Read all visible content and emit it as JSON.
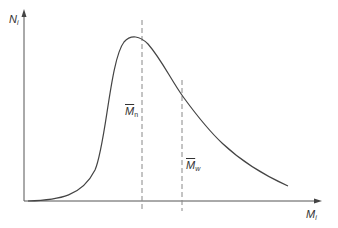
{
  "diagram": {
    "type": "distribution-curve",
    "y_axis": {
      "label": "N",
      "subscript": "i"
    },
    "x_axis": {
      "label": "M",
      "subscript": "i"
    },
    "markers": [
      {
        "id": "mn",
        "label": "M",
        "subscript": "n",
        "overbar": true
      },
      {
        "id": "mw",
        "label": "M",
        "subscript": "w",
        "overbar": true
      }
    ],
    "colors": {
      "curve": "#444444",
      "axes": "#555555",
      "dashed": "#888888",
      "text": "#333333"
    }
  }
}
